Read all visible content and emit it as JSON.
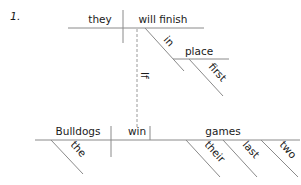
{
  "diagram": {
    "number": "1.",
    "top_clause": {
      "subject": "they",
      "verb": "will finish",
      "preposition": "in",
      "object": "place",
      "object_modifier": "first"
    },
    "connector": "If",
    "bottom_clause": {
      "subject": "Bulldogs",
      "subject_modifier": "the",
      "verb": "win",
      "object": "games",
      "object_modifiers": [
        "their",
        "last",
        "two"
      ]
    },
    "colors": {
      "line": "#8a8a8a",
      "text": "#1a1a1a"
    }
  }
}
